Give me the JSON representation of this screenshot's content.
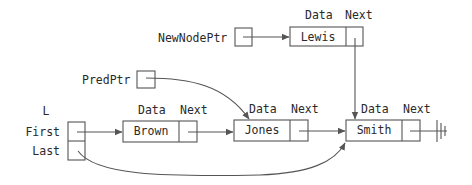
{
  "diagram": {
    "type": "linked-list-insertion",
    "pointers": {
      "new_node_ptr": "NewNodePtr",
      "pred_ptr": "PredPtr"
    },
    "list_header": {
      "name": "L",
      "first_label": "First",
      "last_label": "Last"
    },
    "field_labels": {
      "data": "Data",
      "next": "Next"
    },
    "new_node": {
      "data": "Lewis"
    },
    "nodes": [
      {
        "data": "Brown"
      },
      {
        "data": "Jones"
      },
      {
        "data": "Smith"
      }
    ],
    "null_terminator": "ground-symbol"
  }
}
